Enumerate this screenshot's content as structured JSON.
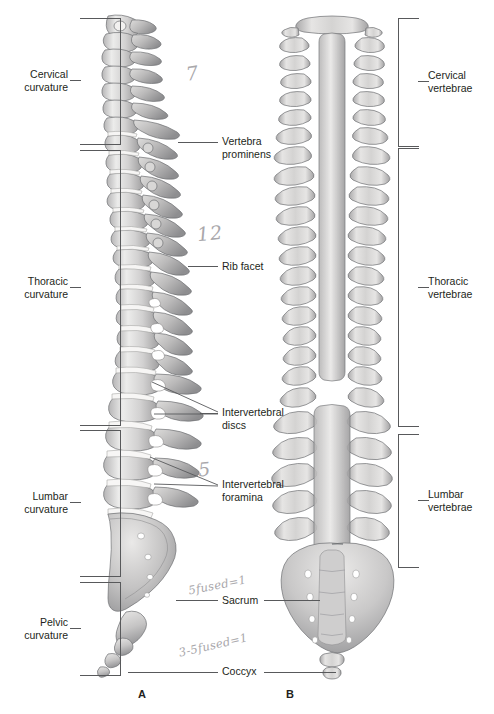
{
  "figure": {
    "panel_a_letter": "A",
    "panel_b_letter": "B"
  },
  "left_brackets": [
    {
      "id": "cervical-curvature",
      "label": "Cervical\ncurvature"
    },
    {
      "id": "thoracic-curvature",
      "label": "Thoracic\ncurvature"
    },
    {
      "id": "lumbar-curvature",
      "label": "Lumbar\ncurvature"
    },
    {
      "id": "pelvic-curvature",
      "label": "Pelvic\ncurvature"
    }
  ],
  "right_brackets": [
    {
      "id": "cervical-vertebrae",
      "label": "Cervical\nvertebrae"
    },
    {
      "id": "thoracic-vertebrae",
      "label": "Thoracic\nvertebrae"
    },
    {
      "id": "lumbar-vertebrae",
      "label": "Lumbar\nvertebrae"
    }
  ],
  "center_labels": [
    {
      "id": "vertebra-prominens",
      "label": "Vertebra\nprominens"
    },
    {
      "id": "rib-facet",
      "label": "Rib facet"
    },
    {
      "id": "intervertebral-discs",
      "label": "Intervertebral\ndiscs"
    },
    {
      "id": "intervertebral-foramina",
      "label": "Intervertebral\nforamina"
    },
    {
      "id": "sacrum",
      "label": "Sacrum"
    },
    {
      "id": "coccyx",
      "label": "Coccyx"
    }
  ],
  "handwritten": [
    {
      "id": "cervical-count",
      "text": "7"
    },
    {
      "id": "thoracic-count",
      "text": "12"
    },
    {
      "id": "lumbar-count",
      "text": "5"
    },
    {
      "id": "sacrum-note",
      "text": "5fused=1"
    },
    {
      "id": "coccyx-note",
      "text": "3-5fused=1"
    }
  ],
  "colors": {
    "bone_light": "#e8e7e6",
    "bone_mid": "#c2c1c2",
    "bone_dark": "#9a9a9b",
    "bone_shadow": "#7e7e80",
    "line": "#58595b",
    "text": "#231f20",
    "pencil": "#a9a7ab",
    "background": "#ffffff"
  }
}
